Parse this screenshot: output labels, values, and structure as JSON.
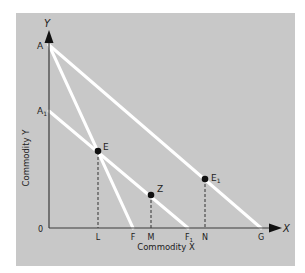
{
  "diagram": {
    "type": "budget-line-diagram",
    "background_color": "#c8c8c8",
    "axis_color": "#3a3a3a",
    "line_color": "#ffffff",
    "point_color": "#111111",
    "axes": {
      "x_label": "Commodity X",
      "y_label": "Commodity Y",
      "x_arrow_label": "X",
      "y_arrow_label": "Y",
      "origin_label": "0"
    },
    "y_intercepts": [
      {
        "id": "A",
        "label": "A",
        "sub": ""
      },
      {
        "id": "A1",
        "label": "A",
        "sub": "1"
      }
    ],
    "x_ticks": [
      {
        "id": "L",
        "label": "L",
        "sub": ""
      },
      {
        "id": "F",
        "label": "F",
        "sub": ""
      },
      {
        "id": "M",
        "label": "M",
        "sub": ""
      },
      {
        "id": "F1",
        "label": "F",
        "sub": "1"
      },
      {
        "id": "N",
        "label": "N",
        "sub": ""
      },
      {
        "id": "G",
        "label": "G",
        "sub": ""
      }
    ],
    "lines": [
      {
        "name": "budget-line-AG",
        "from": "A",
        "to": "G"
      },
      {
        "name": "budget-line-AF",
        "from": "A",
        "to": "F"
      },
      {
        "name": "budget-line-A1F1",
        "from": "A1",
        "to": "F1"
      }
    ],
    "points": [
      {
        "id": "E",
        "label": "E",
        "sub": "",
        "drop_to": "L"
      },
      {
        "id": "Z",
        "label": "Z",
        "sub": "",
        "drop_to": "M"
      },
      {
        "id": "E1",
        "label": "E",
        "sub": "1",
        "drop_to": "N"
      }
    ]
  }
}
